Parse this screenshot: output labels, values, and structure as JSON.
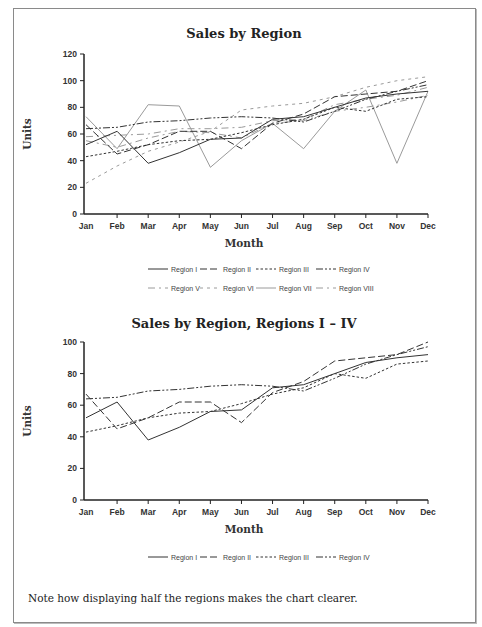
{
  "note": "Note how displaying half the regions makes the chart clearer.",
  "chart_data": [
    {
      "type": "line",
      "title": "Sales by Region",
      "xlabel": "Month",
      "ylabel": "Units",
      "ylim": [
        0,
        120
      ],
      "yticks": [
        0,
        20,
        40,
        60,
        80,
        100,
        120
      ],
      "grid": false,
      "legend_position": "bottom",
      "categories": [
        "Jan",
        "Feb",
        "Mar",
        "Apr",
        "May",
        "Jun",
        "Jul",
        "Aug",
        "Sep",
        "Oct",
        "Nov",
        "Dec"
      ],
      "series": [
        {
          "name": "Region I",
          "style": "solid",
          "color": "#333333",
          "values": [
            52,
            62,
            38,
            46,
            56,
            57,
            71,
            73,
            80,
            87,
            90,
            92
          ]
        },
        {
          "name": "Region II",
          "style": "long-dash",
          "color": "#333333",
          "values": [
            67,
            45,
            52,
            62,
            62,
            49,
            68,
            75,
            88,
            90,
            92,
            100
          ]
        },
        {
          "name": "Region III",
          "style": "short-dash",
          "color": "#333333",
          "values": [
            43,
            47,
            52,
            55,
            56,
            61,
            67,
            71,
            80,
            77,
            86,
            88
          ]
        },
        {
          "name": "Region IV",
          "style": "dash-dot-dot",
          "color": "#333333",
          "values": [
            64,
            65,
            69,
            70,
            72,
            73,
            72,
            69,
            77,
            86,
            92,
            97
          ]
        },
        {
          "name": "Region V",
          "style": "long-short-dash",
          "color": "#9a9a9a",
          "values": [
            58,
            59,
            60,
            64,
            64,
            65,
            70,
            71,
            82,
            86,
            89,
            95
          ]
        },
        {
          "name": "Region VI",
          "style": "spaced-dash",
          "color": "#9a9a9a",
          "values": [
            23,
            36,
            47,
            54,
            62,
            78,
            81,
            83,
            88,
            95,
            100,
            103
          ]
        },
        {
          "name": "Region VII",
          "style": "solid",
          "color": "#9a9a9a",
          "values": [
            73,
            49,
            82,
            81,
            35,
            55,
            68,
            49,
            77,
            93,
            38,
            92
          ]
        },
        {
          "name": "Region VIII",
          "style": "long-short-dash",
          "color": "#9a9a9a",
          "values": [
            55,
            50,
            57,
            62,
            61,
            57,
            68,
            70,
            77,
            80,
            84,
            89
          ]
        }
      ]
    },
    {
      "type": "line",
      "title": "Sales by Region, Regions I – IV",
      "xlabel": "Month",
      "ylabel": "Units",
      "ylim": [
        0,
        100
      ],
      "yticks": [
        0,
        20,
        40,
        60,
        80,
        100
      ],
      "grid": false,
      "legend_position": "bottom",
      "categories": [
        "Jan",
        "Feb",
        "Mar",
        "Apr",
        "May",
        "Jun",
        "Jul",
        "Aug",
        "Sep",
        "Oct",
        "Nov",
        "Dec"
      ],
      "series": [
        {
          "name": "Region I",
          "style": "solid",
          "color": "#333333",
          "values": [
            52,
            62,
            38,
            46,
            56,
            57,
            71,
            73,
            80,
            87,
            90,
            92
          ]
        },
        {
          "name": "Region II",
          "style": "long-dash",
          "color": "#333333",
          "values": [
            67,
            45,
            52,
            62,
            62,
            49,
            68,
            75,
            88,
            90,
            92,
            100
          ]
        },
        {
          "name": "Region III",
          "style": "short-dash",
          "color": "#333333",
          "values": [
            43,
            47,
            52,
            55,
            56,
            61,
            67,
            71,
            80,
            77,
            86,
            88
          ]
        },
        {
          "name": "Region IV",
          "style": "dash-dot-dot",
          "color": "#333333",
          "values": [
            64,
            65,
            69,
            70,
            72,
            73,
            72,
            69,
            77,
            86,
            92,
            97
          ]
        }
      ]
    }
  ]
}
